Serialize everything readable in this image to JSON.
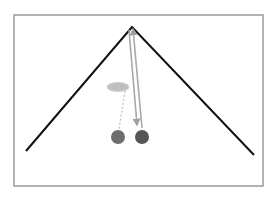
{
  "diagram": {
    "canvas": {
      "width": 274,
      "height": 204,
      "background": "#ffffff"
    },
    "frame": {
      "x": 14,
      "y": 15,
      "width": 249,
      "height": 171,
      "stroke": "#9a9a9a",
      "stroke_width": 1.5
    },
    "ramp": {
      "points": [
        [
          26,
          151
        ],
        [
          132,
          27
        ],
        [
          254,
          155
        ]
      ],
      "stroke": "#111111",
      "stroke_width": 2
    },
    "ellipse": {
      "cx": 118,
      "cy": 87,
      "rx": 11,
      "ry": 4.5,
      "fill": "#b5b5b5",
      "stroke": "#c8c8c8"
    },
    "lines": [
      {
        "name": "string-to-right-ball",
        "x1": 129,
        "y1": 30,
        "x2": 137,
        "y2": 125,
        "stroke": "#a8a8a8",
        "width": 1.6,
        "arrow": "end"
      },
      {
        "name": "string-up-arrow",
        "x1": 142,
        "y1": 128,
        "x2": 133,
        "y2": 29,
        "stroke": "#a8a8a8",
        "width": 1.6,
        "arrow": "end"
      },
      {
        "name": "dashed-to-left-ball",
        "x1": 125,
        "y1": 91,
        "x2": 119,
        "y2": 129,
        "stroke": "#c4c4c4",
        "width": 1.4,
        "dashed": true
      }
    ],
    "balls": [
      {
        "name": "left-ball",
        "cx": 118,
        "cy": 137,
        "r": 7,
        "fill": "#6e6e6e"
      },
      {
        "name": "right-ball",
        "cx": 142,
        "cy": 137,
        "r": 7,
        "fill": "#555555"
      }
    ]
  }
}
